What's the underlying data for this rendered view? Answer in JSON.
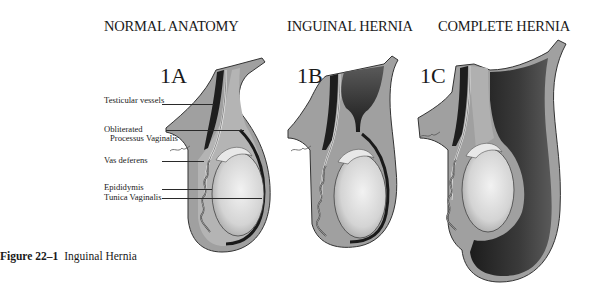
{
  "figure": {
    "caption_number": "Figure 22–1",
    "caption_title": "Inguinal Hernia"
  },
  "panels": [
    {
      "id": "1A",
      "label": "1A",
      "heading": "NORMAL ANATOMY"
    },
    {
      "id": "1B",
      "label": "1B",
      "heading": "INGUINAL HERNIA"
    },
    {
      "id": "1C",
      "label": "1C",
      "heading": "COMPLETE HERNIA"
    }
  ],
  "annotations": [
    {
      "text": "Testicular vessels"
    },
    {
      "text": "Obliterated"
    },
    {
      "text": "Processus Vaginalis"
    },
    {
      "text": "Vas deferens"
    },
    {
      "text": "Epididymis"
    },
    {
      "text": "Tunica Vaginalis"
    }
  ],
  "colors": {
    "background": "#ffffff",
    "tissue_gray": "#9a9a9a",
    "light_tissue": "#c8c8c8",
    "testis": "#dcdcdc",
    "hernia_dark": "#2a2a2a",
    "outline": "#333333"
  }
}
